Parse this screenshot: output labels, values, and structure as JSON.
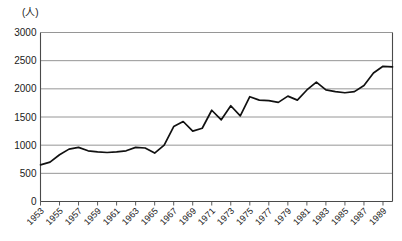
{
  "chart_data": {
    "type": "line",
    "title": "",
    "subtitle": "",
    "unit_label": "(人)",
    "xlabel": "",
    "ylabel": "",
    "ylim": [
      0,
      3000
    ],
    "xlim": [
      1953,
      1990
    ],
    "grid": true,
    "legend": null,
    "y_ticks": [
      0,
      500,
      1000,
      1500,
      2000,
      2500,
      3000
    ],
    "y_tick_labels": [
      "0",
      "500",
      "1000",
      "1500",
      "2000",
      "2500",
      "3000"
    ],
    "x_tick_labels": [
      "1953",
      "1955",
      "1957",
      "1959",
      "1961",
      "1963",
      "1965",
      "1967",
      "1969",
      "1971",
      "1973",
      "1975",
      "1977",
      "1979",
      "1981",
      "1983",
      "1985",
      "1987",
      "1989"
    ],
    "x": [
      1953,
      1954,
      1955,
      1956,
      1957,
      1958,
      1959,
      1960,
      1961,
      1962,
      1963,
      1964,
      1965,
      1966,
      1967,
      1968,
      1969,
      1970,
      1971,
      1972,
      1973,
      1974,
      1975,
      1976,
      1977,
      1978,
      1979,
      1980,
      1981,
      1982,
      1983,
      1984,
      1985,
      1986,
      1987,
      1988,
      1989,
      1990
    ],
    "values": [
      650,
      700,
      830,
      930,
      960,
      900,
      880,
      870,
      880,
      900,
      960,
      950,
      860,
      1000,
      1330,
      1420,
      1250,
      1300,
      1620,
      1450,
      1700,
      1520,
      1860,
      1800,
      1790,
      1760,
      1870,
      1800,
      1980,
      2120,
      1980,
      1950,
      1930,
      1950,
      2060,
      2280,
      2400,
      2390
    ],
    "series": [
      {
        "name": "",
        "values": [
          650,
          700,
          830,
          930,
          960,
          900,
          880,
          870,
          880,
          900,
          960,
          950,
          860,
          1000,
          1330,
          1420,
          1250,
          1300,
          1620,
          1450,
          1700,
          1520,
          1860,
          1800,
          1790,
          1760,
          1870,
          1800,
          1980,
          2120,
          1980,
          1950,
          1930,
          1950,
          2060,
          2280,
          2400,
          2390
        ]
      }
    ],
    "colors": {
      "line": "#111111",
      "grid": "#8a8a8a",
      "axis": "#4a4a4a",
      "background": "#ffffff",
      "text": "#1a1a1a"
    }
  }
}
